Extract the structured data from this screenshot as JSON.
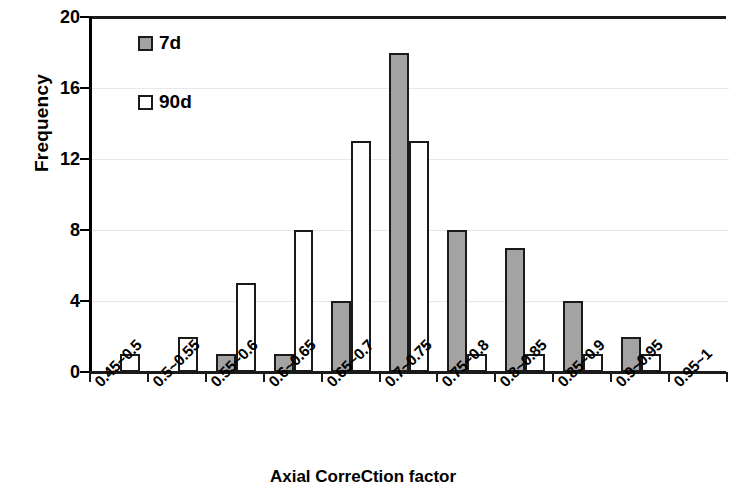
{
  "chart_data": {
    "type": "bar",
    "title": "",
    "xlabel": "Axial CorreCtion factor",
    "ylabel": "Frequency",
    "categories": [
      "0.45~0.5",
      "0.5~0.55",
      "0.55~0.6",
      "0.6~0.65",
      "0.65~0.7",
      "0.7~0.75",
      "0.75~0.8",
      "0.8~0.85",
      "0.85~0.9",
      "0.9~0.95",
      "0.95~1"
    ],
    "series": [
      {
        "name": "7d",
        "values": [
          0,
          0,
          1,
          1,
          4,
          18,
          8,
          7,
          4,
          2,
          0
        ],
        "color": "#a3a3a3"
      },
      {
        "name": "90d",
        "values": [
          1,
          2,
          5,
          8,
          13,
          13,
          1,
          1,
          1,
          1,
          0
        ],
        "color": "#ffffff"
      }
    ],
    "ylim": [
      0,
      20
    ],
    "yticks": [
      0,
      4,
      8,
      12,
      16,
      20
    ],
    "ytick_labels": [
      "0",
      "4",
      "8",
      "12",
      "16",
      "20"
    ],
    "grid": true,
    "grid_axis": "y",
    "legend_position": "upper-left-inside",
    "bar_edge_color": "#1a1a1a",
    "axis_color": "#1a1a1a"
  },
  "legend": {
    "items": [
      {
        "label": "7d",
        "swatch": "filled-gray-square"
      },
      {
        "label": "90d",
        "swatch": "empty-white-square"
      }
    ]
  }
}
